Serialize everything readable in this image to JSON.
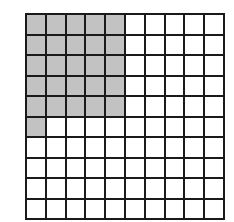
{
  "diagram": {
    "type": "hundred-grid",
    "rows": 10,
    "cols": 10,
    "shaded_count": 26,
    "total_cells": 100,
    "shaded_color": "#c2c2c2",
    "unshaded_color": "#ffffff",
    "line_color": "#1a1a1a",
    "shaded_cells_by_row": [
      5,
      5,
      5,
      5,
      5,
      1,
      0,
      0,
      0,
      0
    ]
  }
}
